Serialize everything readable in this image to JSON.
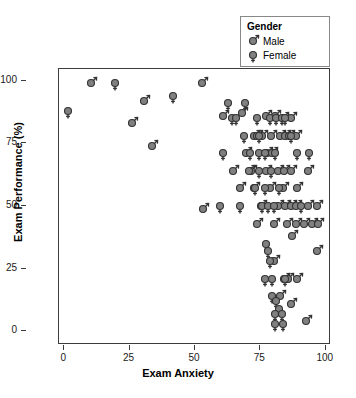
{
  "chart_data": {
    "type": "scatter",
    "title": "",
    "xlabel": "Exam Anxiety",
    "ylabel": "Exam Performance (%)",
    "xlim": [
      -2,
      102
    ],
    "ylim": [
      -5,
      105
    ],
    "xticks": [
      0,
      25,
      50,
      75,
      100
    ],
    "yticks": [
      0,
      25,
      50,
      75,
      100
    ],
    "grid": false,
    "legend": {
      "title": "Gender",
      "position": "top-right",
      "entries": [
        {
          "label": "Male",
          "marker": "mars-symbol",
          "color": "#808080"
        },
        {
          "label": "Female",
          "marker": "venus-symbol",
          "color": "#808080"
        }
      ]
    },
    "marker_fill": "#808080",
    "marker_stroke": "#333333",
    "series": [
      {
        "name": "Male",
        "marker": "mars-symbol",
        "points": [
          [
            9.5,
            100
          ],
          [
            30.0,
            93
          ],
          [
            52.0,
            100
          ],
          [
            25.5,
            84
          ],
          [
            33.0,
            75
          ],
          [
            52.5,
            50
          ],
          [
            60.0,
            87
          ],
          [
            67.5,
            88
          ],
          [
            72.0,
            79
          ],
          [
            73.0,
            79
          ],
          [
            75.0,
            79
          ],
          [
            76.5,
            87
          ],
          [
            77.0,
            72
          ],
          [
            78.5,
            79
          ],
          [
            80.0,
            87
          ],
          [
            82.0,
            79
          ],
          [
            83.0,
            86
          ],
          [
            84.0,
            79
          ],
          [
            85.5,
            79
          ],
          [
            86.0,
            86
          ],
          [
            88.0,
            79
          ],
          [
            69.0,
            72
          ],
          [
            71.0,
            65
          ],
          [
            79.0,
            72
          ],
          [
            64.0,
            65
          ],
          [
            70.0,
            65
          ],
          [
            76.5,
            65
          ],
          [
            81.0,
            65
          ],
          [
            83.5,
            65
          ],
          [
            86.0,
            65
          ],
          [
            92.5,
            65
          ],
          [
            66.5,
            58
          ],
          [
            72.0,
            58
          ],
          [
            78.0,
            58
          ],
          [
            83.0,
            58
          ],
          [
            88.5,
            58
          ],
          [
            74.5,
            51
          ],
          [
            81.0,
            51
          ],
          [
            84.0,
            51
          ],
          [
            86.0,
            51
          ],
          [
            88.0,
            51
          ],
          [
            92.5,
            51
          ],
          [
            96.0,
            51
          ],
          [
            73.0,
            44
          ],
          [
            79.5,
            44
          ],
          [
            84.5,
            44
          ],
          [
            88.0,
            44
          ],
          [
            91.0,
            44
          ],
          [
            94.0,
            44
          ],
          [
            96.5,
            44
          ],
          [
            86.5,
            39
          ],
          [
            96.0,
            33
          ],
          [
            79.5,
            29
          ],
          [
            83.5,
            22
          ],
          [
            85.0,
            22
          ],
          [
            88.5,
            22
          ],
          [
            82.0,
            15
          ],
          [
            86.0,
            12
          ],
          [
            92.0,
            5
          ]
        ]
      },
      {
        "name": "Female",
        "marker": "venus-symbol",
        "points": [
          [
            1.0,
            89
          ],
          [
            19.0,
            100
          ],
          [
            41.0,
            95
          ],
          [
            62.0,
            92
          ],
          [
            68.5,
            92
          ],
          [
            63.5,
            86
          ],
          [
            65.0,
            86
          ],
          [
            73.0,
            86
          ],
          [
            78.0,
            86
          ],
          [
            80.5,
            86
          ],
          [
            82.5,
            86
          ],
          [
            84.0,
            86
          ],
          [
            68.0,
            79
          ],
          [
            74.0,
            79
          ],
          [
            86.0,
            79
          ],
          [
            60.0,
            72
          ],
          [
            70.5,
            72
          ],
          [
            74.0,
            72
          ],
          [
            76.0,
            72
          ],
          [
            80.0,
            72
          ],
          [
            88.5,
            72
          ],
          [
            93.0,
            72
          ],
          [
            74.0,
            65
          ],
          [
            78.5,
            65
          ],
          [
            72.5,
            58
          ],
          [
            76.0,
            58
          ],
          [
            81.5,
            58
          ],
          [
            59.0,
            51
          ],
          [
            66.5,
            51
          ],
          [
            75.0,
            51
          ],
          [
            77.5,
            51
          ],
          [
            79.5,
            51
          ],
          [
            90.0,
            51
          ],
          [
            76.5,
            36
          ],
          [
            77.5,
            33
          ],
          [
            78.0,
            29
          ],
          [
            76.0,
            22
          ],
          [
            79.0,
            22
          ],
          [
            84.0,
            22
          ],
          [
            79.0,
            15
          ],
          [
            80.5,
            13
          ],
          [
            81.5,
            10
          ],
          [
            80.0,
            8
          ],
          [
            82.5,
            8
          ],
          [
            80.0,
            4
          ],
          [
            83.0,
            4
          ]
        ]
      }
    ]
  }
}
